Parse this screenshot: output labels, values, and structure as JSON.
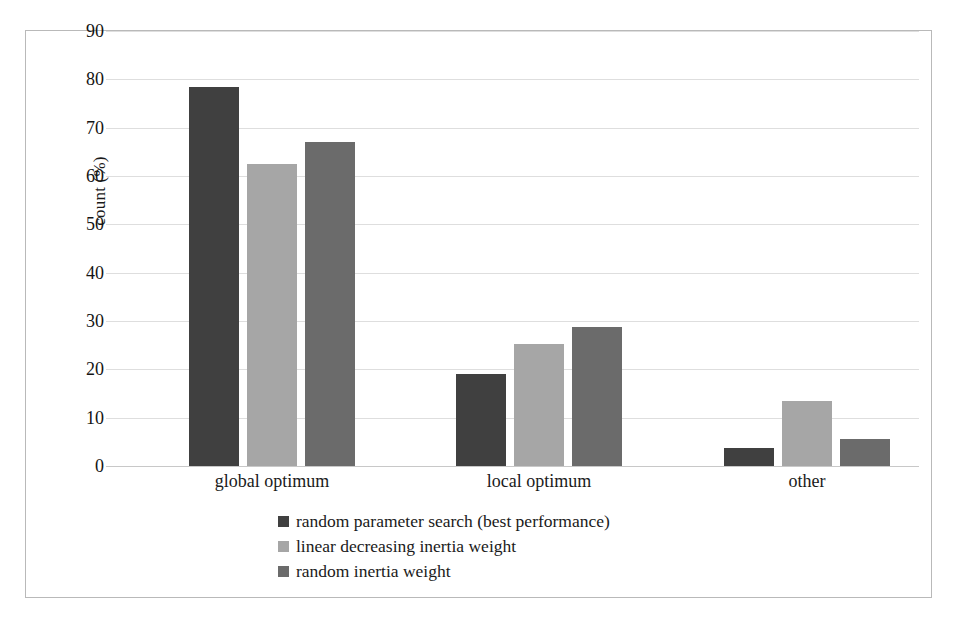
{
  "chart_data": {
    "type": "bar",
    "title": "",
    "xlabel": "",
    "ylabel": "count (%)",
    "categories": [
      "global optimum",
      "local optimum",
      "other"
    ],
    "series": [
      {
        "name": "random parameter search (best performance)",
        "color": "#404040",
        "values": [
          78.5,
          19.0,
          3.7
        ]
      },
      {
        "name": "linear decreasing inertia weight",
        "color": "#a6a6a6",
        "values": [
          62.5,
          25.3,
          13.5
        ]
      },
      {
        "name": "random inertia weight",
        "color": "#6b6b6b",
        "values": [
          67.0,
          28.8,
          5.5
        ]
      }
    ],
    "ylim": [
      0,
      90
    ],
    "yticks": [
      0,
      10,
      20,
      30,
      40,
      50,
      60,
      70,
      80,
      90
    ],
    "ytick_labels": [
      "0",
      "10",
      "20",
      "30",
      "40",
      "50",
      "60",
      "70",
      "80",
      "90"
    ],
    "grid": true,
    "legend_position": "bottom"
  },
  "axis": {
    "y_label": "count (%)"
  }
}
